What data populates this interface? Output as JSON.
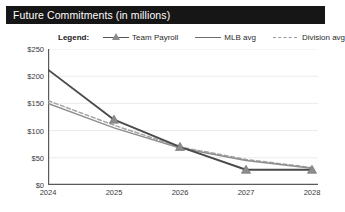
{
  "header": {
    "title": "Future Commitments (in millions)",
    "background_color": "#161616",
    "text_color": "#ffffff"
  },
  "legend": {
    "title": "Legend:",
    "position": "top",
    "entries": [
      {
        "label": "Team Payroll",
        "style": "line-with-triangle-marker",
        "color": "#4a4a4a"
      },
      {
        "label": "MLB avg",
        "style": "solid-line",
        "color": "#8e8e8e"
      },
      {
        "label": "Division avg",
        "style": "dashed-line",
        "color": "#a5a5a5"
      }
    ]
  },
  "chart_data": {
    "type": "line",
    "title": "Future Commitments (in millions)",
    "xlabel": "",
    "ylabel": "",
    "grid": true,
    "legend_position": "top",
    "categories": [
      "2024",
      "2025",
      "2026",
      "2027",
      "2028"
    ],
    "x": [
      2024,
      2025,
      2026,
      2027,
      2028
    ],
    "ylim": [
      0,
      250
    ],
    "ytick_values": [
      0,
      50,
      100,
      150,
      200,
      250
    ],
    "ytick_labels": [
      "$0",
      "$50",
      "$100",
      "$150",
      "$200",
      "$250"
    ],
    "xtick_labels": [
      "2024",
      "2025",
      "2026",
      "2027",
      "2028"
    ],
    "series": [
      {
        "name": "Team Payroll",
        "color": "#4a4a4a",
        "style": "solid",
        "marker": "triangle",
        "values": [
          212,
          120,
          70,
          28,
          28
        ]
      },
      {
        "name": "MLB avg",
        "color": "#8e8e8e",
        "style": "solid",
        "marker": "none",
        "values": [
          150,
          105,
          68,
          45,
          31
        ]
      },
      {
        "name": "Division avg",
        "color": "#a5a5a5",
        "style": "dashed",
        "marker": "none",
        "values": [
          155,
          110,
          70,
          47,
          32
        ]
      }
    ]
  }
}
